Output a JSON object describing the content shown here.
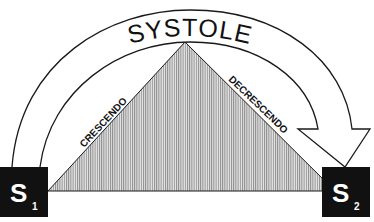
{
  "title": "SYSTOLE",
  "left_label": "CRESCENDO",
  "right_label": "DECRESCENDO",
  "s1": {
    "letter": "S",
    "sub": "1"
  },
  "s2": {
    "letter": "S",
    "sub": "2"
  },
  "colors": {
    "box": "#111111",
    "line": "#1a1a1a",
    "hatch": "#8a8a8a",
    "bg": "#ffffff"
  }
}
